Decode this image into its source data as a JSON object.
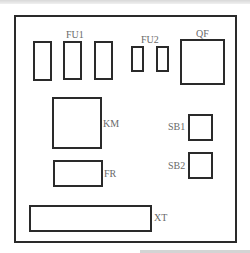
{
  "diagram": {
    "type": "electrical-panel-layout",
    "components": {
      "fu1": {
        "label": "FU1",
        "count": 3
      },
      "fu2": {
        "label": "FU2",
        "count": 2
      },
      "qf": {
        "label": "QF"
      },
      "km": {
        "label": "KM"
      },
      "fr": {
        "label": "FR"
      },
      "sb1": {
        "label": "SB1"
      },
      "sb2": {
        "label": "SB2"
      },
      "xt": {
        "label": "XT"
      }
    },
    "colors": {
      "stroke": "#2a2a2a",
      "label": "#6a6a6a",
      "background": "#ffffff"
    }
  }
}
